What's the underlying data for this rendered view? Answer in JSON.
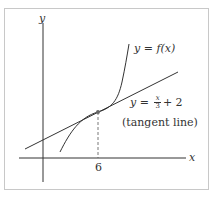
{
  "diagram": {
    "axes": {
      "x_label": "x",
      "y_label": "y"
    },
    "curve": {
      "label_prefix": "y = ",
      "label_func": "f(x)"
    },
    "tangent": {
      "label_prefix": "y = ",
      "frac_num": "x",
      "frac_den": "3",
      "label_suffix": "+ 2",
      "note": "(tangent line)"
    },
    "point": {
      "x_tick_label": "6"
    },
    "colors": {
      "stroke": "#333333",
      "frame": "#c8c8c8",
      "point": "#666666"
    }
  }
}
